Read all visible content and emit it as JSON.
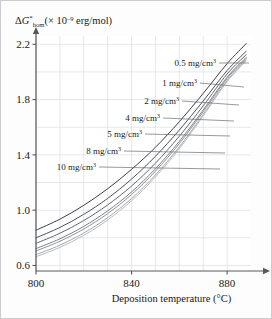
{
  "figure": {
    "background_color": "#fdfdfd",
    "border_color": "#c9cdd2",
    "grid_color": "#d8dfe6",
    "axis_color": "#55585c",
    "curve_color_dark": "#3c3f43",
    "curve_color_light": "#b9bcc0"
  },
  "chart_data": {
    "type": "line",
    "title": "",
    "subtitle": "",
    "xlabel": "Deposition temperature (°C)",
    "ylabel": "ΔG*hom (× 10⁻⁹ erg/mol)",
    "ylabel_parts": {
      "delta": "Δ",
      "symbol": "G",
      "superscript": "*",
      "subscript": "hom",
      "units_prefix": "(× 10",
      "units_exponent": "–9",
      "units_suffix": " erg/mol)"
    },
    "xlim": [
      800,
      890
    ],
    "ylim": [
      0.56,
      2.26
    ],
    "xticks": [
      800,
      840,
      880
    ],
    "xtick_labels": [
      "800",
      "840",
      "880"
    ],
    "yticks": [
      0.6,
      1.0,
      1.4,
      1.8,
      2.2
    ],
    "ytick_labels": [
      "0.6",
      "1.0",
      "1.4",
      "1.8",
      "2.2"
    ],
    "x_minor_gridlines": [
      810,
      820,
      830,
      850,
      860,
      870
    ],
    "y_minor_gridlines": [
      0.8,
      1.2,
      1.6,
      2.0
    ],
    "grid": true,
    "legend": "inline-leader-labels",
    "legend_position": "inside-upper-left-to-right",
    "x": [
      800,
      810,
      820,
      830,
      840,
      850,
      860,
      870,
      880,
      888
    ],
    "series": [
      {
        "name": "0.5 mg/cm3",
        "label": "0.5 mg/cm",
        "label_exponent": "3",
        "values": [
          0.855,
          0.935,
          1.035,
          1.155,
          1.295,
          1.455,
          1.64,
          1.845,
          2.06,
          2.205
        ],
        "shade": "#3c3f43"
      },
      {
        "name": "1 mg/cm3",
        "label": "1 mg/cm",
        "label_exponent": "3",
        "values": [
          0.8,
          0.875,
          0.97,
          1.085,
          1.225,
          1.39,
          1.58,
          1.79,
          2.01,
          2.15
        ],
        "shade": "#4e5156"
      },
      {
        "name": "2 mg/cm3",
        "label": "2 mg/cm",
        "label_exponent": "3",
        "values": [
          0.76,
          0.833,
          0.925,
          1.038,
          1.175,
          1.34,
          1.535,
          1.755,
          1.985,
          2.125
        ],
        "shade": "#65686d"
      },
      {
        "name": "4 mg/cm3",
        "label": "4 mg/cm",
        "label_exponent": "3",
        "values": [
          0.722,
          0.793,
          0.883,
          0.995,
          1.132,
          1.3,
          1.498,
          1.725,
          1.962,
          2.105
        ],
        "shade": "#7e8185"
      },
      {
        "name": "5 mg/cm3",
        "label": "5 mg/cm",
        "label_exponent": "3",
        "values": [
          0.705,
          0.775,
          0.864,
          0.975,
          1.113,
          1.282,
          1.482,
          1.712,
          1.952,
          2.097
        ],
        "shade": "#8f9296"
      },
      {
        "name": "8 mg/cm3",
        "label": "8 mg/cm",
        "label_exponent": "3",
        "values": [
          0.678,
          0.747,
          0.835,
          0.946,
          1.084,
          1.255,
          1.458,
          1.693,
          1.938,
          2.086
        ],
        "shade": "#a5a8ac"
      },
      {
        "name": "10 mg/cm3",
        "label": "10 mg/cm",
        "label_exponent": "3",
        "values": [
          0.663,
          0.731,
          0.818,
          0.929,
          1.068,
          1.24,
          1.445,
          1.682,
          1.93,
          2.08
        ],
        "shade": "#b9bcc0"
      }
    ],
    "annotations": [
      {
        "text": "0.5 mg/cm",
        "exp": "3",
        "text_x": 215,
        "text_y": 62,
        "leader_to_x": 248,
        "leader_to_y": 62
      },
      {
        "text": "1 mg/cm",
        "exp": "3",
        "text_x": 196,
        "text_y": 82,
        "leader_to_x": 243,
        "leader_to_y": 86
      },
      {
        "text": "2 mg/cm",
        "exp": "3",
        "text_x": 178,
        "text_y": 100,
        "leader_to_x": 238,
        "leader_to_y": 104
      },
      {
        "text": "4 mg/cm",
        "exp": "3",
        "text_x": 159,
        "text_y": 117,
        "leader_to_x": 233,
        "leader_to_y": 120
      },
      {
        "text": "5 mg/cm",
        "exp": "3",
        "text_x": 141,
        "text_y": 133,
        "leader_to_x": 229,
        "leader_to_y": 135
      },
      {
        "text": "8 mg/cm",
        "exp": "3",
        "text_x": 120,
        "text_y": 150,
        "leader_to_x": 224,
        "leader_to_y": 152
      },
      {
        "text": "10 mg/cm",
        "exp": "3",
        "text_x": 95,
        "text_y": 166,
        "leader_to_x": 219,
        "leader_to_y": 168
      }
    ]
  }
}
